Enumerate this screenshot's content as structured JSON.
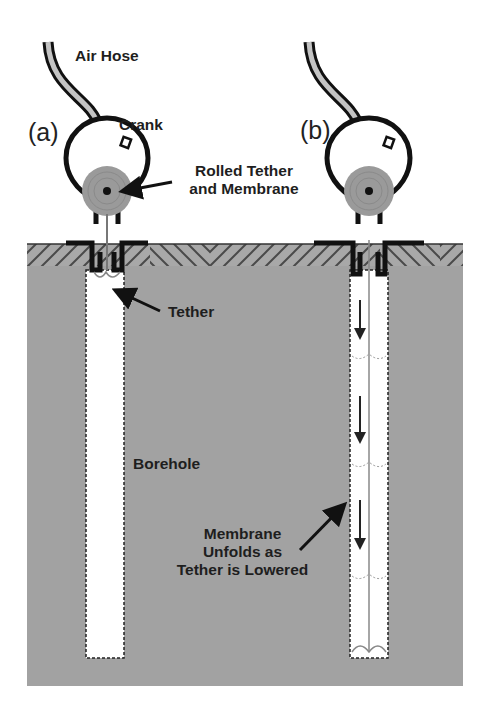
{
  "figure": {
    "panels": [
      {
        "id": "a",
        "label": "(a)"
      },
      {
        "id": "b",
        "label": "(b)"
      }
    ],
    "labels": {
      "air_hose": "Air Hose",
      "crank": "Crank",
      "rolled_line1": "Rolled Tether",
      "rolled_line2": "and Membrane",
      "tether": "Tether",
      "borehole": "Borehole",
      "unfold_line1": "Membrane",
      "unfold_line2": "Unfolds as",
      "unfold_line3": "Tether is Lowered"
    },
    "colors": {
      "ground": "#a2a2a2",
      "hatch_dark": "#555555",
      "roll": "#9a9a9a",
      "hose_fill": "#c4c4c4",
      "outline": "#111111",
      "hole": "#ffffff"
    }
  }
}
